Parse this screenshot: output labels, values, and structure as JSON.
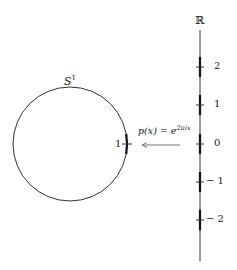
{
  "diagram": {
    "circle_label": "S",
    "circle_label_sup": "1",
    "circle_point_label": "1",
    "map_label_lhs": "p(x) = e",
    "map_label_sup": "2πix",
    "axis_label": "ℝ",
    "ticks": [
      {
        "label": "2",
        "y": 67
      },
      {
        "label": "1",
        "y": 105
      },
      {
        "label": "0",
        "y": 144
      },
      {
        "label": "− 1",
        "y": 182
      },
      {
        "label": "− 2",
        "y": 220
      }
    ],
    "colors": {
      "stroke": "#333333",
      "highlight": "#111111"
    }
  }
}
